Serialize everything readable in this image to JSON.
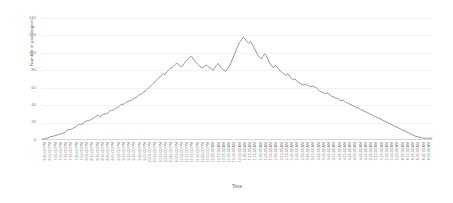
{
  "chart_data": {
    "type": "line",
    "title": "",
    "xlabel": "Time",
    "ylabel": "Number of passengers",
    "ylim": [
      0,
      140
    ],
    "yticks": [
      0,
      20,
      40,
      60,
      80,
      100,
      120,
      140
    ],
    "grid": true,
    "legend": "none",
    "line_color": "#8a8a8a",
    "grid_color": "#f2f2f2",
    "axis_color": "#d8d8d8",
    "text_color": "#7a7a7a",
    "categories": [
      "6:45:00 PM",
      "6:55:00 PM",
      "7:05:00 PM",
      "7:15:00 PM",
      "7:25:00 PM",
      "7:35:00 PM",
      "7:45:00 PM",
      "7:55:00 PM",
      "8:05:00 PM",
      "8:15:00 PM",
      "8:25:00 PM",
      "8:35:00 PM",
      "8:45:00 PM",
      "8:55:00 PM",
      "9:05:00 PM",
      "9:15:00 PM",
      "9:25:00 PM",
      "9:35:00 PM",
      "9:45:00 PM",
      "9:55:00 PM",
      "10:05:00 PM",
      "10:15:00 PM",
      "10:25:00 PM",
      "10:35:00 PM",
      "10:45:00 PM",
      "10:55:00 PM",
      "11:05:00 PM",
      "11:15:00 PM",
      "11:25:00 PM",
      "11:35:00 PM",
      "11:45:00 PM",
      "11:55:00 PM",
      "12:05:00 AM",
      "12:15:00 AM",
      "12:25:00 AM",
      "12:35:00 AM",
      "12:45:00 AM",
      "12:55:00 AM",
      "1:05:00 AM",
      "1:15:00 AM",
      "1:25:00 AM",
      "1:35:00 AM",
      "1:45:00 AM",
      "1:55:00 AM",
      "2:05:00 AM",
      "2:15:00 AM",
      "2:25:00 AM",
      "2:35:00 AM",
      "2:45:00 AM",
      "2:55:00 AM",
      "3:05:00 AM",
      "3:15:00 AM",
      "3:25:00 AM",
      "3:35:00 AM",
      "3:45:00 AM",
      "3:55:00 AM",
      "4:05:00 AM",
      "4:15:00 AM",
      "4:25:00 AM",
      "4:35:00 AM",
      "4:45:00 AM",
      "4:55:00 AM",
      "5:05:00 AM",
      "5:15:00 AM",
      "5:25:00 AM",
      "5:35:00 AM",
      "5:45:00 AM",
      "5:55:00 AM",
      "6:05:00 AM",
      "6:15:00 AM",
      "6:25:00 AM",
      "6:35:00 AM",
      "6:45:00 AM",
      "6:55:00 AM"
    ],
    "values": [
      1,
      1,
      2,
      2,
      3,
      4,
      5,
      6,
      8,
      9,
      11,
      12,
      13,
      15,
      16,
      18,
      19,
      20,
      22,
      21,
      23,
      24,
      26,
      25,
      27,
      29,
      30,
      31,
      33,
      34,
      33,
      35,
      36,
      38,
      39,
      41,
      40,
      42,
      44,
      46,
      48,
      47,
      49,
      51,
      53,
      55,
      57,
      56,
      59,
      62,
      64,
      63,
      67,
      70,
      66,
      72,
      75,
      78,
      76,
      80,
      83,
      86,
      84,
      88,
      92,
      90,
      87,
      85,
      83,
      88,
      86,
      84,
      82,
      80
    ],
    "series_detail": [
      {
        "t": "6:45:00 PM",
        "v": 1
      },
      {
        "t": "6:50:00 PM",
        "v": 1
      },
      {
        "t": "6:55:00 PM",
        "v": 2
      },
      {
        "t": "7:00:00 PM",
        "v": 3
      },
      {
        "t": "7:05:00 PM",
        "v": 4
      },
      {
        "t": "7:10:00 PM",
        "v": 5
      },
      {
        "t": "7:15:00 PM",
        "v": 7
      },
      {
        "t": "7:20:00 PM",
        "v": 8
      },
      {
        "t": "7:25:00 PM",
        "v": 10
      },
      {
        "t": "7:30:00 PM",
        "v": 12
      },
      {
        "t": "7:35:00 PM",
        "v": 13
      },
      {
        "t": "7:40:00 PM",
        "v": 14
      },
      {
        "t": "7:45:00 PM",
        "v": 16
      },
      {
        "t": "7:50:00 PM",
        "v": 17
      },
      {
        "t": "7:55:00 PM",
        "v": 19
      },
      {
        "t": "8:00:00 PM",
        "v": 21
      },
      {
        "t": "8:05:00 PM",
        "v": 22
      },
      {
        "t": "8:10:00 PM",
        "v": 24
      },
      {
        "t": "8:15:00 PM",
        "v": 25
      },
      {
        "t": "8:20:00 PM",
        "v": 24
      },
      {
        "t": "8:25:00 PM",
        "v": 26
      },
      {
        "t": "8:30:00 PM",
        "v": 28
      },
      {
        "t": "8:35:00 PM",
        "v": 30
      },
      {
        "t": "8:40:00 PM",
        "v": 32
      },
      {
        "t": "8:45:00 PM",
        "v": 34
      },
      {
        "t": "8:50:00 PM",
        "v": 36
      },
      {
        "t": "8:55:00 PM",
        "v": 38
      },
      {
        "t": "9:00:00 PM",
        "v": 40
      },
      {
        "t": "9:05:00 PM",
        "v": 43
      },
      {
        "t": "9:10:00 PM",
        "v": 46
      },
      {
        "t": "9:15:00 PM",
        "v": 49
      },
      {
        "t": "9:20:00 PM",
        "v": 52
      },
      {
        "t": "9:25:00 PM",
        "v": 55
      },
      {
        "t": "9:30:00 PM",
        "v": 53
      },
      {
        "t": "9:35:00 PM",
        "v": 58
      },
      {
        "t": "9:40:00 PM",
        "v": 62
      },
      {
        "t": "9:45:00 PM",
        "v": 66
      },
      {
        "t": "9:50:00 PM",
        "v": 70
      },
      {
        "t": "9:55:00 PM",
        "v": 74
      },
      {
        "t": "10:00:00 PM",
        "v": 78
      },
      {
        "t": "10:05:00 PM",
        "v": 82
      },
      {
        "t": "10:10:00 PM",
        "v": 86
      },
      {
        "t": "10:15:00 PM",
        "v": 84
      },
      {
        "t": "10:20:00 PM",
        "v": 88
      },
      {
        "t": "10:25:00 PM",
        "v": 92
      },
      {
        "t": "10:30:00 PM",
        "v": 96
      },
      {
        "t": "10:35:00 PM",
        "v": 100
      },
      {
        "t": "10:40:00 PM",
        "v": 97
      },
      {
        "t": "10:45:00 PM",
        "v": 94
      },
      {
        "t": "10:50:00 PM",
        "v": 90
      },
      {
        "t": "10:55:00 PM",
        "v": 86
      },
      {
        "t": "11:00:00 PM",
        "v": 88
      },
      {
        "t": "11:05:00 PM",
        "v": 84
      },
      {
        "t": "11:10:00 PM",
        "v": 87
      },
      {
        "t": "11:15:00 PM",
        "v": 90
      },
      {
        "t": "11:20:00 PM",
        "v": 95
      },
      {
        "t": "11:25:00 PM",
        "v": 100
      },
      {
        "t": "11:30:00 PM",
        "v": 108
      },
      {
        "t": "11:35:00 PM",
        "v": 112
      },
      {
        "t": "11:40:00 PM",
        "v": 118
      },
      {
        "t": "11:45:00 PM",
        "v": 115
      },
      {
        "t": "11:50:00 PM",
        "v": 112
      },
      {
        "t": "11:55:00 PM",
        "v": 113
      },
      {
        "t": "12:00:00 AM",
        "v": 105
      },
      {
        "t": "12:05:00 AM",
        "v": 98
      },
      {
        "t": "12:10:00 AM",
        "v": 93
      },
      {
        "t": "12:15:00 AM",
        "v": 96
      },
      {
        "t": "12:20:00 AM",
        "v": 90
      },
      {
        "t": "12:25:00 AM",
        "v": 85
      },
      {
        "t": "12:30:00 AM",
        "v": 88
      },
      {
        "t": "12:35:00 AM",
        "v": 83
      },
      {
        "t": "12:40:00 AM",
        "v": 80
      },
      {
        "t": "12:45:00 AM",
        "v": 78
      },
      {
        "t": "12:50:00 AM",
        "v": 74
      },
      {
        "t": "12:55:00 AM",
        "v": 72
      },
      {
        "t": "1:00:00 AM",
        "v": 70
      },
      {
        "t": "1:05:00 AM",
        "v": 68
      },
      {
        "t": "1:10:00 AM",
        "v": 66
      },
      {
        "t": "1:15:00 AM",
        "v": 64
      },
      {
        "t": "1:20:00 AM",
        "v": 63
      },
      {
        "t": "1:25:00 AM",
        "v": 61
      },
      {
        "t": "1:30:00 AM",
        "v": 60
      },
      {
        "t": "1:35:00 AM",
        "v": 58
      },
      {
        "t": "1:40:00 AM",
        "v": 56
      },
      {
        "t": "1:45:00 AM",
        "v": 54
      },
      {
        "t": "1:50:00 AM",
        "v": 52
      },
      {
        "t": "1:55:00 AM",
        "v": 50
      },
      {
        "t": "2:00:00 AM",
        "v": 48
      },
      {
        "t": "2:05:00 AM",
        "v": 46
      },
      {
        "t": "2:10:00 AM",
        "v": 44
      },
      {
        "t": "2:15:00 AM",
        "v": 42
      },
      {
        "t": "2:20:00 AM",
        "v": 40
      },
      {
        "t": "2:25:00 AM",
        "v": 38
      },
      {
        "t": "2:30:00 AM",
        "v": 36
      },
      {
        "t": "2:35:00 AM",
        "v": 34
      },
      {
        "t": "2:40:00 AM",
        "v": 32
      },
      {
        "t": "2:45:00 AM",
        "v": 30
      },
      {
        "t": "2:50:00 AM",
        "v": 28
      },
      {
        "t": "2:55:00 AM",
        "v": 26
      },
      {
        "t": "3:00:00 AM",
        "v": 24
      },
      {
        "t": "3:05:00 AM",
        "v": 22
      },
      {
        "t": "3:10:00 AM",
        "v": 20
      },
      {
        "t": "3:15:00 AM",
        "v": 18
      },
      {
        "t": "3:20:00 AM",
        "v": 16
      },
      {
        "t": "3:25:00 AM",
        "v": 14
      },
      {
        "t": "3:30:00 AM",
        "v": 12
      },
      {
        "t": "3:35:00 AM",
        "v": 10
      },
      {
        "t": "3:40:00 AM",
        "v": 8
      },
      {
        "t": "3:45:00 AM",
        "v": 6
      },
      {
        "t": "3:50:00 AM",
        "v": 4
      },
      {
        "t": "3:55:00 AM",
        "v": 3
      },
      {
        "t": "4:00:00 AM",
        "v": 2
      },
      {
        "t": "4:05:00 AM",
        "v": 2
      },
      {
        "t": "4:10:00 AM",
        "v": 1
      }
    ],
    "points": [
      [
        0,
        1
      ],
      [
        1,
        1
      ],
      [
        2,
        2
      ],
      [
        3,
        2
      ],
      [
        4,
        3
      ],
      [
        5,
        4
      ],
      [
        6,
        4
      ],
      [
        7,
        5
      ],
      [
        8,
        5
      ],
      [
        9,
        6
      ],
      [
        10,
        7
      ],
      [
        11,
        7
      ],
      [
        12,
        8
      ],
      [
        13,
        9
      ],
      [
        14,
        11
      ],
      [
        15,
        12
      ],
      [
        16,
        12
      ],
      [
        17,
        13
      ],
      [
        18,
        14
      ],
      [
        19,
        15
      ],
      [
        20,
        17
      ],
      [
        21,
        18
      ],
      [
        22,
        18
      ],
      [
        23,
        19
      ],
      [
        24,
        21
      ],
      [
        25,
        22
      ],
      [
        26,
        22
      ],
      [
        27,
        23
      ],
      [
        28,
        24
      ],
      [
        29,
        25
      ],
      [
        30,
        27
      ],
      [
        31,
        28
      ],
      [
        32,
        28
      ],
      [
        33,
        26
      ],
      [
        34,
        29
      ],
      [
        35,
        30
      ],
      [
        36,
        30
      ],
      [
        37,
        31
      ],
      [
        38,
        33
      ],
      [
        39,
        34
      ],
      [
        40,
        34
      ],
      [
        41,
        36
      ],
      [
        42,
        37
      ],
      [
        43,
        38
      ],
      [
        44,
        40
      ],
      [
        45,
        41
      ],
      [
        46,
        41
      ],
      [
        47,
        43
      ],
      [
        48,
        44
      ],
      [
        49,
        45
      ],
      [
        50,
        45
      ],
      [
        51,
        47
      ],
      [
        52,
        48
      ],
      [
        53,
        49
      ],
      [
        54,
        51
      ],
      [
        55,
        52
      ],
      [
        56,
        53
      ],
      [
        57,
        55
      ],
      [
        58,
        56
      ],
      [
        59,
        58
      ],
      [
        60,
        60
      ],
      [
        61,
        62
      ],
      [
        62,
        64
      ],
      [
        63,
        66
      ],
      [
        64,
        68
      ],
      [
        65,
        70
      ],
      [
        66,
        72
      ],
      [
        67,
        74
      ],
      [
        68,
        76
      ],
      [
        69,
        75
      ],
      [
        70,
        78
      ],
      [
        71,
        80
      ],
      [
        72,
        82
      ],
      [
        73,
        83
      ],
      [
        74,
        85
      ],
      [
        75,
        87
      ],
      [
        76,
        88
      ],
      [
        77,
        86
      ],
      [
        78,
        84
      ],
      [
        79,
        85
      ],
      [
        80,
        88
      ],
      [
        81,
        91
      ],
      [
        82,
        93
      ],
      [
        83,
        95
      ],
      [
        84,
        96
      ],
      [
        85,
        93
      ],
      [
        86,
        90
      ],
      [
        87,
        88
      ],
      [
        88,
        86
      ],
      [
        89,
        84
      ],
      [
        90,
        83
      ],
      [
        91,
        84
      ],
      [
        92,
        86
      ],
      [
        93,
        85
      ],
      [
        94,
        83
      ],
      [
        95,
        82
      ],
      [
        96,
        80
      ],
      [
        97,
        83
      ],
      [
        98,
        86
      ],
      [
        99,
        88
      ],
      [
        100,
        84
      ],
      [
        101,
        82
      ],
      [
        102,
        80
      ],
      [
        103,
        79
      ],
      [
        104,
        81
      ],
      [
        105,
        84
      ],
      [
        106,
        88
      ],
      [
        107,
        93
      ],
      [
        108,
        98
      ],
      [
        109,
        103
      ],
      [
        110,
        108
      ],
      [
        111,
        112
      ],
      [
        112,
        115
      ],
      [
        113,
        118
      ],
      [
        114,
        116
      ],
      [
        115,
        113
      ],
      [
        116,
        111
      ],
      [
        117,
        113
      ],
      [
        118,
        110
      ],
      [
        119,
        106
      ],
      [
        120,
        102
      ],
      [
        121,
        98
      ],
      [
        122,
        95
      ],
      [
        123,
        93
      ],
      [
        124,
        96
      ],
      [
        125,
        99
      ],
      [
        126,
        96
      ],
      [
        127,
        92
      ],
      [
        128,
        88
      ],
      [
        129,
        85
      ],
      [
        130,
        83
      ],
      [
        131,
        86
      ],
      [
        132,
        84
      ],
      [
        133,
        81
      ],
      [
        134,
        79
      ],
      [
        135,
        77
      ],
      [
        136,
        76
      ],
      [
        137,
        74
      ],
      [
        138,
        76
      ],
      [
        139,
        73
      ],
      [
        140,
        71
      ],
      [
        141,
        69
      ],
      [
        142,
        70
      ],
      [
        143,
        68
      ],
      [
        144,
        66
      ],
      [
        145,
        65
      ],
      [
        146,
        64
      ],
      [
        147,
        63
      ],
      [
        148,
        64
      ],
      [
        149,
        63
      ],
      [
        150,
        62
      ],
      [
        151,
        61
      ],
      [
        152,
        62
      ],
      [
        153,
        61
      ],
      [
        154,
        60
      ],
      [
        155,
        58
      ],
      [
        156,
        56
      ],
      [
        157,
        55
      ],
      [
        158,
        54
      ],
      [
        159,
        53
      ],
      [
        160,
        54
      ],
      [
        161,
        53
      ],
      [
        162,
        51
      ],
      [
        163,
        50
      ],
      [
        164,
        49
      ],
      [
        165,
        48
      ],
      [
        166,
        48
      ],
      [
        167,
        46
      ],
      [
        168,
        45
      ],
      [
        169,
        46
      ],
      [
        170,
        44
      ],
      [
        171,
        43
      ],
      [
        172,
        42
      ],
      [
        173,
        41
      ],
      [
        174,
        40
      ],
      [
        175,
        39
      ],
      [
        176,
        38
      ],
      [
        177,
        37
      ],
      [
        178,
        36
      ],
      [
        179,
        35
      ],
      [
        180,
        34
      ],
      [
        181,
        33
      ],
      [
        182,
        32
      ],
      [
        183,
        31
      ],
      [
        184,
        30
      ],
      [
        185,
        29
      ],
      [
        186,
        28
      ],
      [
        187,
        27
      ],
      [
        188,
        26
      ],
      [
        189,
        25
      ],
      [
        190,
        24
      ],
      [
        191,
        23
      ],
      [
        192,
        22
      ],
      [
        193,
        21
      ],
      [
        194,
        20
      ],
      [
        195,
        19
      ],
      [
        196,
        18
      ],
      [
        197,
        17
      ],
      [
        198,
        16
      ],
      [
        199,
        15
      ],
      [
        200,
        14
      ],
      [
        201,
        13
      ],
      [
        202,
        12
      ],
      [
        203,
        11
      ],
      [
        204,
        10
      ],
      [
        205,
        9
      ],
      [
        206,
        8
      ],
      [
        207,
        7
      ],
      [
        208,
        6
      ],
      [
        209,
        5
      ],
      [
        210,
        4
      ],
      [
        211,
        4
      ],
      [
        212,
        3
      ],
      [
        213,
        3
      ],
      [
        214,
        2
      ],
      [
        215,
        2
      ],
      [
        216,
        2
      ],
      [
        217,
        2
      ],
      [
        218,
        2
      ],
      [
        219,
        2
      ]
    ]
  }
}
